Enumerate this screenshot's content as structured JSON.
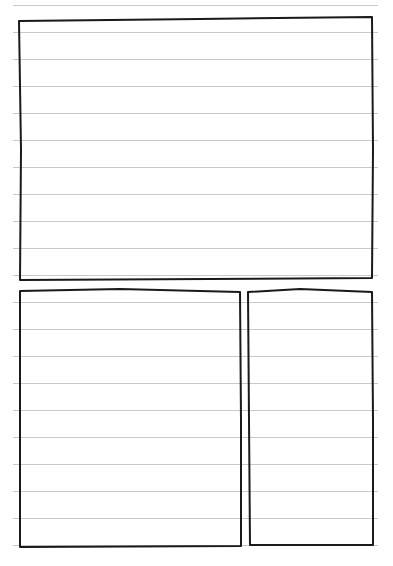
{
  "page": {
    "type": "lined-paper-sketch",
    "background": "#ffffff",
    "rule_color": "#c9c9c9",
    "stroke_color": "#1a1a1a",
    "rules": {
      "x1": 13,
      "x2": 378,
      "first_y": 5,
      "spacing": 27,
      "count": 21
    }
  },
  "boxes": [
    {
      "name": "top-panel",
      "points": "19,21 200,19 372,17 373,150 372,278 20,280 21,150"
    },
    {
      "name": "bottom-left-panel",
      "points": "20,291 120,289 240,292 241,420 241,546 20,547 20,420"
    },
    {
      "name": "bottom-right-panel",
      "points": "248,292 300,289 372,292 373,420 373,545 250,545 249,420"
    }
  ]
}
